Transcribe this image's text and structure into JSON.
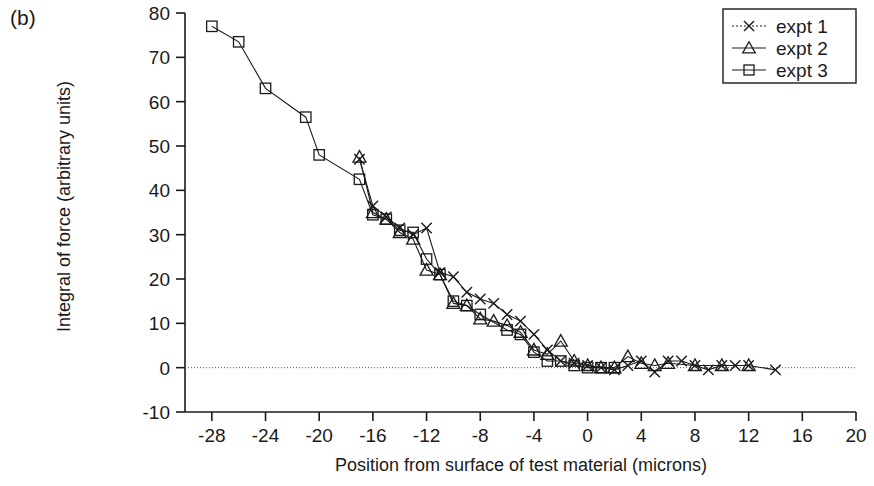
{
  "panel_label": "(b)",
  "chart_data": {
    "type": "line",
    "title": "",
    "subtitle": "",
    "xlabel": "Position from surface of test material (microns)",
    "ylabel": "Integral of force (arbitrary units)",
    "xlim": [
      -30,
      20
    ],
    "ylim": [
      -10,
      80
    ],
    "xticks": [
      -28,
      -24,
      -20,
      -16,
      -12,
      -8,
      -4,
      0,
      4,
      8,
      12,
      16,
      20
    ],
    "xtick_labels": [
      "-28",
      "-24",
      "-20",
      "-16",
      "-12",
      "-8",
      "-4",
      "0",
      "4",
      "8",
      "12",
      "16",
      "20"
    ],
    "yticks": [
      -10,
      0,
      10,
      20,
      30,
      40,
      50,
      60,
      70,
      80
    ],
    "ytick_labels": [
      "-10",
      "0",
      "10",
      "20",
      "30",
      "40",
      "50",
      "60",
      "70",
      "80"
    ],
    "grid": false,
    "zero_line": true,
    "legend_position": "top-right",
    "legend_entries": [
      "expt 1",
      "expt 2",
      "expt 3"
    ],
    "series": [
      {
        "name": "expt 1",
        "marker": "x",
        "color": "#1a1a1a",
        "points": [
          [
            -17,
            47.0
          ],
          [
            -16,
            36.5
          ],
          [
            -15,
            34.0
          ],
          [
            -14,
            31.5
          ],
          [
            -13,
            30.0
          ],
          [
            -12,
            31.5
          ],
          [
            -11,
            21.5
          ],
          [
            -10,
            20.5
          ],
          [
            -9,
            17.0
          ],
          [
            -8,
            15.5
          ],
          [
            -7,
            14.5
          ],
          [
            -6,
            12.0
          ],
          [
            -5,
            10.5
          ],
          [
            -4,
            7.5
          ],
          [
            -3,
            4.0
          ],
          [
            -2,
            1.5
          ],
          [
            -1,
            1.0
          ],
          [
            0,
            0.5
          ],
          [
            1,
            0.0
          ],
          [
            2,
            -0.5
          ],
          [
            3,
            0.5
          ],
          [
            4,
            1.5
          ],
          [
            5,
            -1.0
          ],
          [
            6,
            1.5
          ],
          [
            7,
            1.5
          ],
          [
            8,
            0.5
          ],
          [
            9,
            -0.5
          ],
          [
            10,
            0.5
          ],
          [
            11,
            0.5
          ],
          [
            12,
            0.5
          ],
          [
            14,
            -0.5
          ]
        ]
      },
      {
        "name": "expt 2",
        "marker": "triangle",
        "color": "#1a1a1a",
        "points": [
          [
            -17,
            47.5
          ],
          [
            -16,
            35.0
          ],
          [
            -15,
            33.5
          ],
          [
            -14,
            30.5
          ],
          [
            -13,
            29.0
          ],
          [
            -12,
            22.0
          ],
          [
            -11,
            21.0
          ],
          [
            -10,
            14.5
          ],
          [
            -9,
            14.0
          ],
          [
            -8,
            11.0
          ],
          [
            -7,
            10.5
          ],
          [
            -6,
            9.5
          ],
          [
            -5,
            8.0
          ],
          [
            -4,
            4.0
          ],
          [
            -3,
            3.0
          ],
          [
            -2,
            6.0
          ],
          [
            -1,
            1.5
          ],
          [
            0,
            0.5
          ],
          [
            1,
            0.0
          ],
          [
            2,
            0.0
          ],
          [
            3,
            2.5
          ],
          [
            4,
            1.0
          ],
          [
            5,
            0.5
          ],
          [
            6,
            1.0
          ],
          [
            8,
            0.5
          ],
          [
            10,
            0.5
          ],
          [
            12,
            0.5
          ]
        ]
      },
      {
        "name": "expt 3",
        "marker": "square",
        "color": "#1a1a1a",
        "points": [
          [
            -28,
            77.0
          ],
          [
            -26,
            73.5
          ],
          [
            -24,
            63.0
          ],
          [
            -21,
            56.5
          ],
          [
            -20,
            48.0
          ],
          [
            -17,
            42.5
          ],
          [
            -16,
            34.5
          ],
          [
            -15,
            33.5
          ],
          [
            -14,
            31.0
          ],
          [
            -13,
            30.5
          ],
          [
            -12,
            24.5
          ],
          [
            -11,
            21.0
          ],
          [
            -10,
            15.0
          ],
          [
            -9,
            14.0
          ],
          [
            -8,
            12.0
          ],
          [
            -6,
            8.5
          ],
          [
            -5,
            7.5
          ],
          [
            -4,
            3.5
          ],
          [
            -3,
            1.5
          ],
          [
            -2,
            1.5
          ],
          [
            -1,
            0.5
          ],
          [
            0,
            0.0
          ],
          [
            1,
            0.0
          ],
          [
            2,
            0.0
          ]
        ]
      }
    ]
  }
}
